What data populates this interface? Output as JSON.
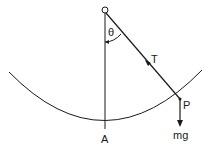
{
  "diagram": {
    "labels": {
      "pivot": "O",
      "angle": "θ",
      "tension": "T",
      "bob": "P",
      "weight": "mg",
      "lowest_point": "A"
    },
    "colors": {
      "line": "#1a1a1a",
      "background": "#ffffff"
    }
  }
}
